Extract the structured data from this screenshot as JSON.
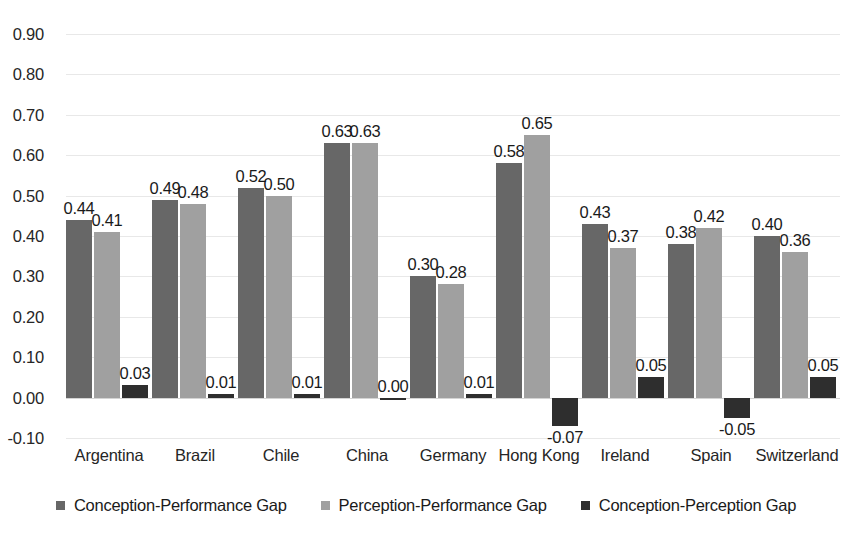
{
  "chart_data": {
    "type": "bar",
    "title": "",
    "subtitle": "",
    "xlabel": "",
    "ylabel": "",
    "ylim": [
      -0.1,
      0.9
    ],
    "ytick_step": 0.1,
    "yticks": [
      "0.90",
      "0.80",
      "0.70",
      "0.60",
      "0.50",
      "0.40",
      "0.30",
      "0.20",
      "0.10",
      "0.00",
      "-0.10"
    ],
    "ytick_values": [
      0.9,
      0.8,
      0.7,
      0.6,
      0.5,
      0.4,
      0.3,
      0.2,
      0.1,
      0.0,
      -0.1
    ],
    "grid": true,
    "legend_position": "bottom",
    "categories": [
      "Argentina",
      "Brazil",
      "Chile",
      "China",
      "Germany",
      "Hong Kong",
      "Ireland",
      "Spain",
      "Switzerland"
    ],
    "series": [
      {
        "name": "Conception-Performance Gap",
        "color": "#676767",
        "values": [
          0.44,
          0.49,
          0.52,
          0.63,
          0.3,
          0.58,
          0.43,
          0.38,
          0.4
        ],
        "labels": [
          "0.44",
          "0.49",
          "0.52",
          "0.63",
          "0.30",
          "0.58",
          "0.43",
          "0.38",
          "0.40"
        ]
      },
      {
        "name": "Perception-Performance Gap",
        "color": "#a0a0a0",
        "values": [
          0.41,
          0.48,
          0.5,
          0.63,
          0.28,
          0.65,
          0.37,
          0.42,
          0.36
        ],
        "labels": [
          "0.41",
          "0.48",
          "0.50",
          "0.63",
          "0.28",
          "0.65",
          "0.37",
          "0.42",
          "0.36"
        ]
      },
      {
        "name": "Conception-Perception Gap",
        "color": "#2e2e2e",
        "values": [
          0.03,
          0.01,
          0.01,
          0.0,
          0.01,
          -0.07,
          0.05,
          -0.05,
          0.05
        ],
        "labels": [
          "0.03",
          "0.01",
          "0.01",
          "0.00",
          "0.01",
          "-0.07",
          "0.05",
          "-0.05",
          "0.05"
        ]
      }
    ]
  },
  "legend": {
    "items": [
      {
        "label": "Conception-Performance Gap",
        "swatch": "s0"
      },
      {
        "label": "Perception-Performance Gap",
        "swatch": "s1"
      },
      {
        "label": "Conception-Perception Gap",
        "swatch": "s2"
      }
    ]
  }
}
